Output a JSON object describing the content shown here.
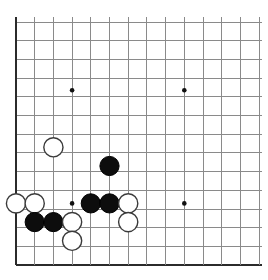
{
  "board": {
    "title": "Go board position",
    "game": "Go (Weiqi / Baduk)",
    "view": "partial board crop — lower-left corner region",
    "grid": {
      "visible_columns": 14,
      "visible_rows": 14,
      "origin_x": 16,
      "origin_y": 22,
      "spacing": 18.7,
      "line_color": "#8a8a8a",
      "edge_color": "#2b2b2b",
      "background_color": "#ffffff"
    },
    "star_points": [
      {
        "name": "star-point-upper-left",
        "col": 3,
        "row": 3.65
      },
      {
        "name": "star-point-upper-right",
        "col": 9,
        "row": 3.65
      },
      {
        "name": "star-point-lower-left",
        "col": 3,
        "row": 9.7
      },
      {
        "name": "star-point-lower-right",
        "col": 9,
        "row": 9.7
      }
    ],
    "stone_radius": 9.6,
    "stones": [
      {
        "id": "w1",
        "color": "white",
        "col": 2,
        "row": 6.7
      },
      {
        "id": "b1",
        "color": "black",
        "col": 5,
        "row": 7.7
      },
      {
        "id": "w2",
        "color": "white",
        "col": 0,
        "row": 9.7
      },
      {
        "id": "w3",
        "color": "white",
        "col": 1,
        "row": 9.7
      },
      {
        "id": "b2",
        "color": "black",
        "col": 4,
        "row": 9.7
      },
      {
        "id": "b3",
        "color": "black",
        "col": 5,
        "row": 9.7
      },
      {
        "id": "w4",
        "color": "white",
        "col": 6,
        "row": 9.7
      },
      {
        "id": "b4",
        "color": "black",
        "col": 1,
        "row": 10.7
      },
      {
        "id": "b5",
        "color": "black",
        "col": 2,
        "row": 10.7
      },
      {
        "id": "w5",
        "color": "white",
        "col": 3,
        "row": 10.7
      },
      {
        "id": "w6",
        "color": "white",
        "col": 6,
        "row": 10.7
      },
      {
        "id": "w7",
        "color": "white",
        "col": 3,
        "row": 11.7
      }
    ],
    "counts": {
      "black_stones": "5",
      "white_stones": "7",
      "total_stones": "12"
    },
    "colors": {
      "black_stone": "#0d0d0d",
      "white_stone": "#ffffff",
      "white_stone_outline": "#3a3a3a",
      "grid": "#8a8a8a",
      "border": "#2b2b2b"
    }
  }
}
